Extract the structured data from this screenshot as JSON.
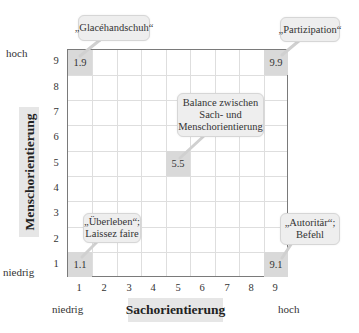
{
  "diagram": {
    "type": "managerial-grid",
    "x_axis": {
      "title": "Sachorientierung",
      "low_label": "niedrig",
      "high_label": "hoch",
      "ticks": [
        "1",
        "2",
        "3",
        "4",
        "5",
        "6",
        "7",
        "8",
        "9"
      ]
    },
    "y_axis": {
      "title": "Menschorientierung",
      "low_label": "niedrig",
      "high_label": "hoch",
      "ticks": [
        "9",
        "8",
        "7",
        "6",
        "5",
        "4",
        "3",
        "2",
        "1"
      ]
    },
    "cells": [
      {
        "value": "1.9",
        "x": 1,
        "y": 9,
        "callout": [
          "„Glacéhandschuh“"
        ]
      },
      {
        "value": "9.9",
        "x": 9,
        "y": 9,
        "callout": [
          "„Partizipation“"
        ]
      },
      {
        "value": "5.5",
        "x": 5,
        "y": 5,
        "callout": [
          "Balance zwischen",
          "Sach- und",
          "Menschorientierung"
        ]
      },
      {
        "value": "1.1",
        "x": 1,
        "y": 1,
        "callout": [
          "„Überleben“;",
          "Laissez faire"
        ]
      },
      {
        "value": "9.1",
        "x": 9,
        "y": 1,
        "callout": [
          "„Autoritär“;",
          "Befehl"
        ]
      }
    ]
  },
  "colors": {
    "cell_fill": "#d9d9d9",
    "callout_fill": "#eeeeee",
    "axis_title_fill": "#e6e6e6",
    "grid_border": "#7a7a7a",
    "grid_lines": "#dedede"
  }
}
